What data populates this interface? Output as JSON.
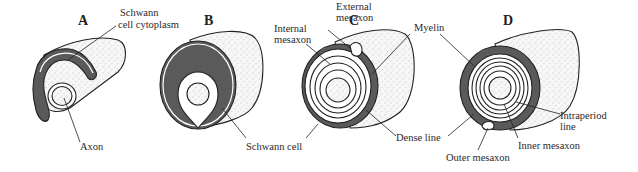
{
  "figure": {
    "panels": [
      {
        "id": "A",
        "label": "A",
        "stage": "Schwann cell engulfing axon"
      },
      {
        "id": "B",
        "label": "B",
        "stage": "Axon enclosed by Schwann cell"
      },
      {
        "id": "C",
        "label": "C",
        "stage": "Schwann cell wrapping around axon"
      },
      {
        "id": "D",
        "label": "D",
        "stage": "Compact myelin sheath"
      }
    ],
    "labels": {
      "schwann_cytoplasm_1": "Schwann",
      "schwann_cytoplasm_2": "cell cytoplasm",
      "axon": "Axon",
      "schwann_cell": "Schwann cell",
      "external_mesaxon_1": "External",
      "external_mesaxon_2": "mesaxon",
      "internal_mesaxon_1": "Internal",
      "internal_mesaxon_2": "mesaxon",
      "dense_line": "Dense line",
      "myelin": "Myelin",
      "intraperiod_line_1": "Intraperiod",
      "intraperiod_line_2": "line",
      "inner_mesaxon": "Inner mesaxon",
      "outer_mesaxon": "Outer mesaxon"
    },
    "colors": {
      "cytoplasm": "#5a5a5a",
      "membrane": "#ffffff",
      "outline": "#222222",
      "axon_fill": "#eeeeee",
      "cylinder_fill": "#f4f4f4"
    }
  }
}
